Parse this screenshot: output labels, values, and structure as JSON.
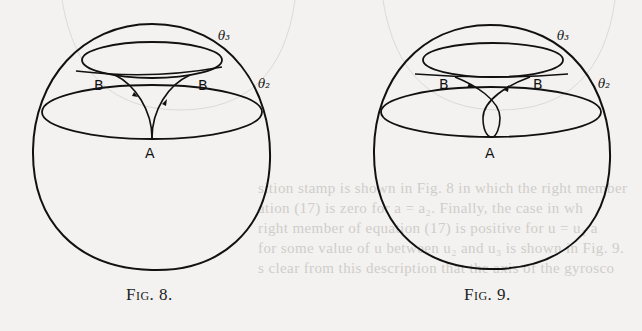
{
  "figures": [
    {
      "caption": "Fig. 8.",
      "labels": {
        "theta3": "θ₃",
        "theta2": "θ₂",
        "b_left": "B",
        "b_right": "B",
        "a": "A"
      },
      "description": "Sphere with two latitude circles θ₂ and θ₃; cusped path from A rising to B points tangent to θ₃ circle, arrows pointing toward A on left branch and away from A on right branch"
    },
    {
      "caption": "Fig. 9.",
      "labels": {
        "theta3": "θ₃",
        "theta2": "θ₂",
        "b_left": "B",
        "b_right": "B",
        "a": "A"
      },
      "description": "Sphere with two latitude circles θ₂ and θ₃; looped path crossing itself above A, rising to B points tangent to θ₃ circle"
    }
  ],
  "bleed_through_text": [
    "sition stamp is shown in Fig. 8 in which the right member",
    "ation (17) is zero for a = a₂. Finally, the case in wh",
    "right member of equation (17) is positive for u = u₂ a",
    "for some value of u between u₂ and u₃ is shown in Fig. 9.",
    "s clear from this description that the axis of the gyrosco"
  ]
}
